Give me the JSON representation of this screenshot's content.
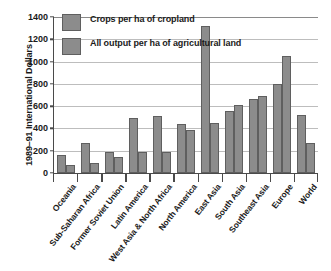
{
  "chart_data": {
    "type": "bar",
    "title": "",
    "xlabel": "",
    "ylabel": "1989–91 International Dollars",
    "ylim": [
      0,
      1400
    ],
    "yticks": [
      0,
      200,
      400,
      600,
      800,
      1000,
      1200,
      1400
    ],
    "grid": true,
    "legend_position": "top-left",
    "categories": [
      "Oceania",
      "Sub-Saharan Africa",
      "Former Soviet Union",
      "Latin America",
      "West Asia & North Africa",
      "North America",
      "East Asia",
      "South Asia",
      "Southeast Asia",
      "Europe",
      "World"
    ],
    "series": [
      {
        "name": "Crops per ha of cropland",
        "values": [
          165,
          270,
          190,
          490,
          510,
          440,
          1320,
          560,
          660,
          800,
          520
        ]
      },
      {
        "name": "All output per ha of agricultural land",
        "values": [
          75,
          90,
          145,
          185,
          190,
          390,
          450,
          610,
          690,
          1050,
          270
        ]
      }
    ]
  },
  "style": {
    "bar_fill": "#8c8c8c",
    "bar_stroke": "#5f5f5f",
    "axis_color": "#4a4a4a",
    "grid_color": "#bdbdbd",
    "text_color": "#1a1a1a",
    "background": "#ffffff"
  }
}
